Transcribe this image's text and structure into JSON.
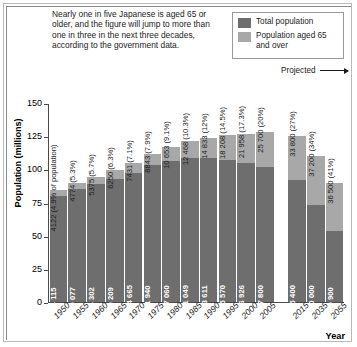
{
  "caption": "Nearly one in five Japanese is aged 65 or older, and the figure will jump to more than one in three in the next three decades, according to the government data.",
  "legend": {
    "items": [
      {
        "label": "Total population",
        "color": "#6e6e6e",
        "name": "legend-total-population"
      },
      {
        "label": "Population aged 65 and over",
        "color": "#a8a8a8",
        "name": "legend-population-65-over"
      }
    ]
  },
  "annotation": {
    "projected": "Projected"
  },
  "axes": {
    "ylabel": "Population (millions)",
    "xlabel": "Year",
    "yticks": [
      0,
      25,
      50,
      75,
      100,
      125,
      150
    ]
  },
  "chart_data": {
    "type": "bar",
    "title": "",
    "subtitle": "",
    "xlabel": "Year",
    "ylabel": "Population (millions)",
    "ylim": [
      0,
      150
    ],
    "grid": false,
    "legend_position": "top-right",
    "stacked": true,
    "unit_note": "values in thousands",
    "categories": [
      "1950",
      "1955",
      "1960",
      "1965",
      "1970",
      "1975",
      "1980",
      "1985",
      "1990",
      "1995",
      "2000",
      "2005",
      "2015",
      "2035",
      "2055"
    ],
    "gap_after": "2005",
    "projected_categories": [
      "2015",
      "2035",
      "2055"
    ],
    "series": [
      {
        "name": "Total population",
        "color": "#6e6e6e",
        "values": [
          84115,
          90077,
          94302,
          99209,
          104665,
          111940,
          117060,
          121049,
          123611,
          125570,
          126926,
          127800,
          125400,
          110000,
          89900
        ],
        "labels": [
          "84 115",
          "90 077",
          "94 302",
          "99 209",
          "104 665",
          "111 940",
          "117 060",
          "121 049",
          "123 611",
          "125 570",
          "126 926",
          "127 800",
          "125 400",
          "110 000",
          "89 900"
        ]
      },
      {
        "name": "Population aged 65 and over",
        "color": "#a8a8a8",
        "values": [
          4122,
          4774,
          5375,
          6250,
          7431,
          8843,
          10653,
          12468,
          14833,
          18208,
          21958,
          25700,
          33800,
          37200,
          36500
        ],
        "percents": [
          "4.9% of population",
          "5.3%",
          "5.7%",
          "6.3%",
          "7.1%",
          "7.9%",
          "9.1%",
          "10.3%",
          "12%",
          "14.5%",
          "17.3%",
          "20%",
          "27%",
          "34%",
          "41%"
        ],
        "labels": [
          "4122 (4.9% of population)",
          "4774 (5.3%)",
          "5375 (5.7%)",
          "6250 (6.3%)",
          "7431 (7.1%)",
          "8843 (7.9%)",
          "10 653 (9.1%)",
          "12 468 (10.3%)",
          "14 833 (12%)",
          "18 208 (14.5%)",
          "21 958 (17.3%)",
          "25 700 (20%)",
          "33 800 (27%)",
          "37 200 (34%)",
          "36 500 (41%)"
        ]
      }
    ]
  }
}
